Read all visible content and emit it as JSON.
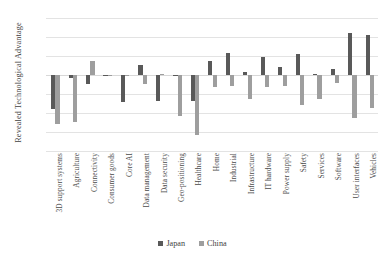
{
  "chart_data": {
    "type": "bar",
    "title": "",
    "xlabel": "",
    "ylabel": "Revealed Technological Advantage",
    "ylim": [
      -0.4,
      0.3
    ],
    "yticks": [
      0.3,
      0.2,
      0.1,
      0.0,
      -0.1,
      -0.2,
      -0.3,
      -0.4
    ],
    "ytick_labels": [
      "0.3",
      "0.2",
      "0.1",
      "0.0",
      "-0.1",
      "-0.2",
      "-0.3",
      "-0.4"
    ],
    "grid": true,
    "legend_position": "bottom",
    "categories": [
      "3D support systems",
      "Agriculture",
      "Connectivity",
      "Consumer goods",
      "Core AI",
      "Data management",
      "Data security",
      "Geo-positioning",
      "Healthcare",
      "Home",
      "Industrial",
      "Infrastructure",
      "IT hardware",
      "Power supply",
      "Safety",
      "Services",
      "Software",
      "User interfaces",
      "Vehicles"
    ],
    "series": [
      {
        "name": "Japan",
        "color": "#595959",
        "values": [
          -0.18,
          -0.015,
          -0.045,
          -0.005,
          -0.14,
          0.055,
          -0.135,
          -0.005,
          -0.135,
          0.075,
          0.115,
          0.015,
          0.095,
          0.04,
          0.11,
          0.005,
          0.03,
          0.22,
          0.21
        ]
      },
      {
        "name": "China",
        "color": "#9e9e9e",
        "values": [
          -0.26,
          -0.245,
          0.075,
          -0.005,
          -0.005,
          -0.045,
          0.005,
          -0.215,
          -0.315,
          -0.065,
          -0.06,
          -0.125,
          -0.065,
          -0.06,
          -0.16,
          -0.125,
          -0.04,
          -0.225,
          -0.175
        ]
      }
    ]
  },
  "legend": {
    "items": [
      {
        "label": "Japan",
        "color": "#595959"
      },
      {
        "label": "China",
        "color": "#9e9e9e"
      }
    ]
  }
}
